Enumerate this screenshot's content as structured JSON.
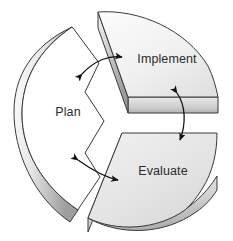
{
  "diagram": {
    "name": "plan-implement-evaluate-cycle",
    "type": "3d-pie-cycle-diagram",
    "background_color": "#ffffff",
    "segments": [
      {
        "id": "plan",
        "label": "Plan",
        "top_face_color": "#ffffff",
        "side_face_color": "#d8d8d8",
        "outline_color": "#3a3a3a",
        "label_x": 68,
        "label_y": 116
      },
      {
        "id": "implement",
        "label": "Implement",
        "top_face_color": "#ededed",
        "side_face_color": "#d2d2d2",
        "outline_color": "#3a3a3a",
        "label_x": 167,
        "label_y": 63
      },
      {
        "id": "evaluate",
        "label": "Evaluate",
        "top_face_color": "#e3e3e3",
        "side_face_color": "#d2d2d2",
        "outline_color": "#3a3a3a",
        "label_x": 163,
        "label_y": 175
      }
    ],
    "arrows": [
      {
        "id": "plan-implement-arrow",
        "name": "arrow-plan-implement",
        "double_headed": true,
        "color": "#1a1a1a"
      },
      {
        "id": "implement-evaluate-arrow",
        "name": "arrow-implement-evaluate",
        "double_headed": true,
        "color": "#1a1a1a"
      },
      {
        "id": "evaluate-plan-arrow",
        "name": "arrow-evaluate-plan",
        "double_headed": true,
        "color": "#1a1a1a"
      }
    ]
  }
}
